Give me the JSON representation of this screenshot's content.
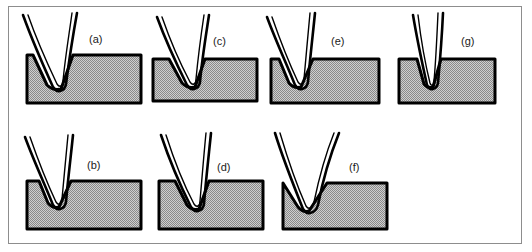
{
  "figure": {
    "caption_present": false,
    "frame_border_color": "#8d8d8d",
    "background_color": "#ffffff",
    "die_fill_color": "#b9b9b9",
    "die_outline_color": "#000000",
    "sheet_outline_color": "#000000",
    "label_color": "#1a1a1a"
  },
  "panels": [
    {
      "id": "a",
      "label": "(a)",
      "row": "top",
      "column": 1,
      "die": {
        "block_x": 26,
        "block_y": 55,
        "block_w": 114,
        "block_h": 48,
        "notch_left": 32,
        "notch_right": 72,
        "notch_depth": 36,
        "notch_bottom_x": 52,
        "notch_type": "v-groove",
        "symmetry": "symmetric"
      },
      "sheet": {
        "bend_angle_deg": 40,
        "left_tip_x": 22,
        "left_tip_y": 16,
        "right_tip_x": 76,
        "right_tip_y": 14,
        "apex_x": 52,
        "apex_y": 90,
        "curvature": "curved-limbs",
        "thickness_px": 3
      },
      "label_pos": {
        "x": 88,
        "y": 38
      }
    },
    {
      "id": "b",
      "label": "(b)",
      "row": "bottom",
      "column": 1,
      "die": {
        "block_x": 26,
        "block_y": 180,
        "block_w": 114,
        "block_h": 48,
        "notch_left": 34,
        "notch_right": 62,
        "notch_depth": 26,
        "notch_bottom_x": 48,
        "notch_type": "v-groove",
        "symmetry": "symmetric"
      },
      "sheet": {
        "bend_angle_deg": 34,
        "left_tip_x": 22,
        "left_tip_y": 14,
        "right_tip_x": 70,
        "right_tip_y": 12,
        "apex_x": 48,
        "apex_y": 80,
        "curvature": "curved-limbs",
        "thickness_px": 3
      },
      "label_pos": {
        "x": 86,
        "y": 46
      }
    },
    {
      "id": "c",
      "label": "(c)",
      "row": "top",
      "column": 2,
      "die": {
        "block_x": 152,
        "block_y": 58,
        "block_w": 104,
        "block_h": 44,
        "notch_left": 22,
        "notch_right": 62,
        "notch_depth": 34,
        "notch_bottom_x": 44,
        "notch_type": "v-groove",
        "symmetry": "symmetric"
      },
      "sheet": {
        "bend_angle_deg": 38,
        "left_tip_x": 12,
        "left_tip_y": 16,
        "right_tip_x": 64,
        "right_tip_y": 12,
        "apex_x": 44,
        "apex_y": 84,
        "curvature": "curved-limbs",
        "thickness_px": 3
      },
      "label_pos": {
        "x": 212,
        "y": 40
      }
    },
    {
      "id": "d",
      "label": "(d)",
      "row": "bottom",
      "column": 2,
      "die": {
        "block_x": 158,
        "block_y": 180,
        "block_w": 104,
        "block_h": 48,
        "notch_left": 28,
        "notch_right": 62,
        "notch_depth": 34,
        "notch_bottom_x": 46,
        "notch_type": "v-groove",
        "symmetry": "symmetric"
      },
      "sheet": {
        "bend_angle_deg": 36,
        "left_tip_x": 16,
        "left_tip_y": 14,
        "right_tip_x": 66,
        "right_tip_y": 10,
        "apex_x": 46,
        "apex_y": 88,
        "curvature": "curved-limbs",
        "thickness_px": 3
      },
      "label_pos": {
        "x": 216,
        "y": 44
      }
    },
    {
      "id": "e",
      "label": "(e)",
      "row": "top",
      "column": 3,
      "die": {
        "block_x": 272,
        "block_y": 58,
        "block_w": 108,
        "block_h": 46,
        "notch_left": 4,
        "notch_right": 40,
        "notch_depth": 32,
        "notch_bottom_x": 24,
        "notch_type": "v-groove",
        "symmetry": "left-offset"
      },
      "sheet": {
        "bend_angle_deg": 34,
        "left_tip_x": -4,
        "left_tip_y": 16,
        "right_tip_x": 44,
        "right_tip_y": 10,
        "apex_x": 24,
        "apex_y": 86,
        "curvature": "curved-limbs",
        "thickness_px": 3
      },
      "label_pos": {
        "x": 330,
        "y": 40
      }
    },
    {
      "id": "f",
      "label": "(f)",
      "row": "bottom",
      "column": 3,
      "die": {
        "block_x": 282,
        "block_y": 182,
        "block_w": 104,
        "block_h": 44,
        "notch_left": 0,
        "notch_right": 54,
        "notch_depth": 28,
        "notch_bottom_x": 28,
        "notch_type": "wide-v-groove",
        "symmetry": "left-offset"
      },
      "sheet": {
        "bend_angle_deg": 56,
        "left_tip_x": -12,
        "left_tip_y": 12,
        "right_tip_x": 64,
        "right_tip_y": 8,
        "apex_x": 28,
        "apex_y": 84,
        "curvature": "curved-limbs",
        "thickness_px": 3
      },
      "label_pos": {
        "x": 348,
        "y": 44
      }
    },
    {
      "id": "g",
      "label": "(g)",
      "row": "top",
      "column": 4,
      "die": {
        "block_x": 400,
        "block_y": 58,
        "block_w": 96,
        "block_h": 46,
        "notch_left": 24,
        "notch_right": 48,
        "notch_depth": 28,
        "notch_bottom_x": 36,
        "notch_type": "narrow-v-groove",
        "symmetry": "symmetric"
      },
      "sheet": {
        "bend_angle_deg": 24,
        "left_tip_x": 20,
        "left_tip_y": 12,
        "right_tip_x": 54,
        "right_tip_y": 10,
        "apex_x": 36,
        "apex_y": 82,
        "curvature": "straight-limbs",
        "thickness_px": 3
      },
      "label_pos": {
        "x": 462,
        "y": 40
      }
    }
  ]
}
